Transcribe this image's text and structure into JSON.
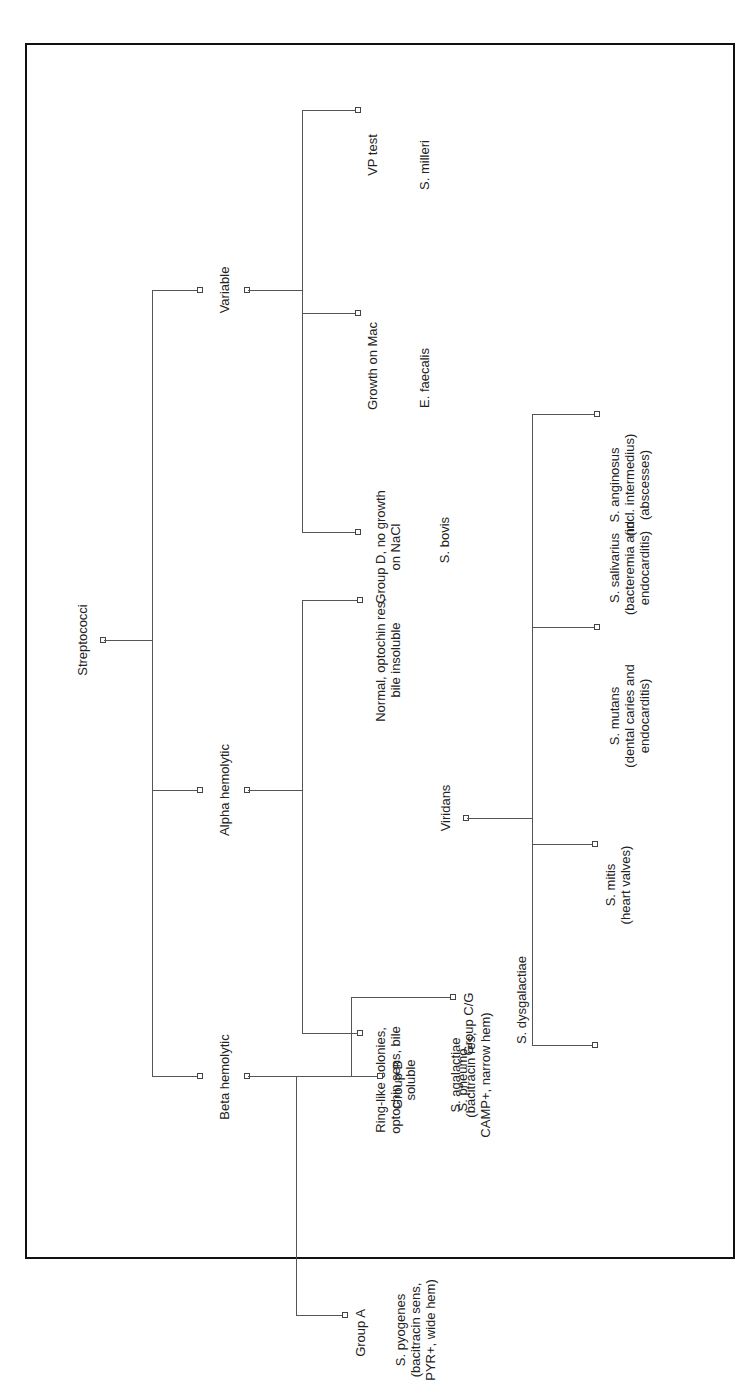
{
  "diagram": {
    "title": "Streptococci",
    "root": {
      "label": "Streptococci"
    },
    "groups": {
      "variable": {
        "label": "Variable",
        "children": [
          {
            "test": "VP test",
            "organism": "S. milleri"
          },
          {
            "test": "Growth on Mac",
            "organism": "E. faecalis"
          },
          {
            "test": "Group D, no growth\non NaCl",
            "organism": "S. bovis"
          }
        ]
      },
      "alpha": {
        "label": "Alpha hemolytic",
        "children": [
          {
            "test": "Normal, optochin res,\nbile insoluble",
            "organism": "Viridans"
          },
          {
            "test": "Ring-like colonies,\noptochin sens, bile\nsoluble",
            "organism": "S. pneumo"
          }
        ],
        "viridans": {
          "label": "Viridans",
          "children": [
            {
              "organism": "S. anginosus\n(incl. intermedius)\n(abscesses)"
            },
            {
              "organism": "S. salivarius\n(bacteremia and\nendocarditis)"
            },
            {
              "organism": "S. mutans\n(dental caries and\nendocarditis)"
            },
            {
              "organism": "S. mitis\n(heart valves)"
            }
          ]
        }
      },
      "beta": {
        "label": "Beta hemolytic",
        "children": [
          {
            "test": "Group A",
            "organism": "S. pyogenes\n(bacitracin sens,\nPYR+, wide hem)"
          },
          {
            "test": "Group B",
            "organism": "S. agalactiae\n(bacitracin res,\nCAMP+, narrow hem)"
          },
          {
            "test": "Group C/G",
            "organism": "S. dysgalactiae"
          }
        ]
      }
    }
  }
}
